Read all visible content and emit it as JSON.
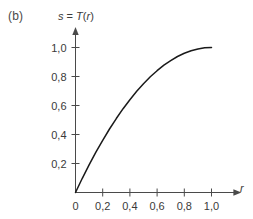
{
  "figure": {
    "panel_label": "(b)",
    "axis_title_prefix": "s",
    "axis_title_equals": " = ",
    "axis_title_func": "T",
    "axis_title_open": "(",
    "axis_title_arg": "r",
    "axis_title_close": ")",
    "axis_title_full": "s = T(r)",
    "x_axis_label": "r",
    "y_axis_label": "s",
    "curve_color": "#1a1a1a",
    "axis_color": "#4a4a4a",
    "text_color": "#3a3a3a",
    "background_color": "#ffffff"
  },
  "chart_data": {
    "type": "line",
    "title": "s = T(r)",
    "xlabel": "r",
    "ylabel": "s",
    "xlim": [
      0,
      1.08
    ],
    "ylim": [
      0,
      1.08
    ],
    "grid": false,
    "legend": false,
    "x_ticks": [
      0,
      0.2,
      0.4,
      0.6,
      0.8,
      1.0
    ],
    "x_tick_labels": [
      "0",
      "0,2",
      "0,4",
      "0,6",
      "0,8",
      "1,0"
    ],
    "y_ticks": [
      0.2,
      0.4,
      0.6,
      0.8,
      1.0
    ],
    "y_tick_labels": [
      "0,2",
      "0,4",
      "0,6",
      "0,8",
      "1,0"
    ],
    "series": [
      {
        "name": "s = T(r)",
        "description": "Concave increasing transformation from (0,0) to (1,1)",
        "x": [
          0.0,
          0.05,
          0.1,
          0.15,
          0.2,
          0.25,
          0.3,
          0.35,
          0.4,
          0.45,
          0.5,
          0.55,
          0.6,
          0.65,
          0.7,
          0.75,
          0.8,
          0.85,
          0.9,
          0.95,
          1.0
        ],
        "y": [
          0.0,
          0.098,
          0.19,
          0.278,
          0.36,
          0.438,
          0.51,
          0.578,
          0.64,
          0.698,
          0.75,
          0.798,
          0.84,
          0.878,
          0.91,
          0.938,
          0.96,
          0.978,
          0.99,
          0.998,
          1.0
        ]
      }
    ]
  }
}
